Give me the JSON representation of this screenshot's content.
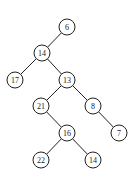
{
  "diagram": {
    "type": "binary-tree",
    "node_radius": 8,
    "nodes": [
      {
        "id": "n6",
        "label": "6",
        "x": 67,
        "y": 27
      },
      {
        "id": "n14a",
        "label": "14",
        "x": 42,
        "y": 53
      },
      {
        "id": "n17",
        "label": "17",
        "x": 15,
        "y": 80
      },
      {
        "id": "n13",
        "label": "13",
        "x": 67,
        "y": 80
      },
      {
        "id": "n21",
        "label": "21",
        "x": 41,
        "y": 106
      },
      {
        "id": "n8",
        "label": "8",
        "x": 93,
        "y": 106
      },
      {
        "id": "n16",
        "label": "16",
        "x": 67,
        "y": 133
      },
      {
        "id": "n7",
        "label": "7",
        "x": 119,
        "y": 133
      },
      {
        "id": "n22",
        "label": "22",
        "x": 41,
        "y": 160
      },
      {
        "id": "n14b",
        "label": "14",
        "x": 93,
        "y": 160
      }
    ],
    "edges": [
      {
        "from": "n6",
        "to": "n14a"
      },
      {
        "from": "n14a",
        "to": "n17"
      },
      {
        "from": "n14a",
        "to": "n13"
      },
      {
        "from": "n13",
        "to": "n21"
      },
      {
        "from": "n13",
        "to": "n8"
      },
      {
        "from": "n21",
        "to": "n16"
      },
      {
        "from": "n8",
        "to": "n7"
      },
      {
        "from": "n16",
        "to": "n22"
      },
      {
        "from": "n16",
        "to": "n14b"
      }
    ]
  }
}
